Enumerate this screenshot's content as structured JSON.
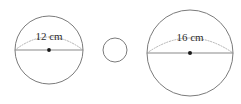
{
  "figure": {
    "background_color": "#ffffff",
    "width": 241,
    "height": 104,
    "stroke_color": "#7b7b7b",
    "line_color": "#8a8a8a",
    "arc_color": "#a8a8a8",
    "dot_color": "#1a1a1a",
    "label_color": "#2b2b2b"
  },
  "shapes": [
    {
      "id": "circle-left",
      "name": "left-circle",
      "cx": 49,
      "cy": 50,
      "r": 34,
      "label": "12 cm",
      "label_x": 49,
      "label_y": 37,
      "label_size": 11,
      "has_diameter_line": true,
      "has_diameter_arc": true,
      "has_center_dot": true,
      "dot_r": 1.9,
      "arc_rise": 13
    },
    {
      "id": "circle-middle",
      "name": "middle-circle",
      "cx": 115,
      "cy": 50,
      "r": 12,
      "label": "",
      "label_x": 115,
      "label_y": 50,
      "label_size": 11,
      "has_diameter_line": false,
      "has_diameter_arc": false,
      "has_center_dot": false,
      "dot_r": 0,
      "arc_rise": 0
    },
    {
      "id": "circle-right",
      "name": "right-circle",
      "cx": 190,
      "cy": 53,
      "r": 43,
      "label": "16 cm",
      "label_x": 190,
      "label_y": 38,
      "label_size": 11,
      "has_diameter_line": true,
      "has_diameter_arc": true,
      "has_center_dot": true,
      "dot_r": 2.0,
      "arc_rise": 15
    }
  ],
  "measurements": {
    "left_diameter": "12 cm",
    "right_diameter": "16 cm",
    "unit": "cm"
  }
}
